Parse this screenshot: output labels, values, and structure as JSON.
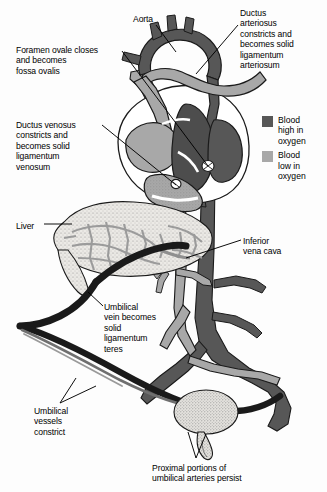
{
  "figure": {
    "background_color": "#fdfdfd",
    "width": 327,
    "height": 492
  },
  "palette": {
    "oxygen_high": "#575757",
    "oxygen_low": "#a8a8a8",
    "constricted_vessel": "#1a1a1a",
    "organ_fill": "#e8e6e2",
    "outline": "#1a1a1a",
    "leader_line": "#000000",
    "text": "#000000"
  },
  "legend": {
    "items": [
      {
        "swatch_color": "#575757",
        "label": "Blood\nhigh in\noxygen",
        "name": "blood-high-oxygen"
      },
      {
        "swatch_color": "#a8a8a8",
        "label": "Blood\nlow in\noxygen",
        "name": "blood-low-oxygen"
      }
    ]
  },
  "labels": [
    {
      "id": "aorta",
      "text": "Aorta",
      "x": 133,
      "y": 14,
      "align": "left"
    },
    {
      "id": "ductus-arteriosus",
      "text": "Ductus\narteriosus\nconstricts and\nbecomes solid\nligamentum\narteriosum",
      "x": 240,
      "y": 8,
      "align": "left"
    },
    {
      "id": "foramen-ovale",
      "text": "Foramen ovale closes\nand becomes\nfossa ovalis",
      "x": 16,
      "y": 45,
      "align": "left"
    },
    {
      "id": "ductus-venosus",
      "text": "Ductus venosus\nconstricts and\nbecomes solid\nligamentum\nvenosum",
      "x": 16,
      "y": 120,
      "align": "left"
    },
    {
      "id": "liver",
      "text": "Liver",
      "x": 16,
      "y": 221,
      "align": "left"
    },
    {
      "id": "inferior-vena-cava",
      "text": "Inferior\nvena cava",
      "x": 243,
      "y": 236,
      "align": "left"
    },
    {
      "id": "umbilical-vein",
      "text": "Umbilical\nvein becomes\nsolid\nligamentum\nteres",
      "x": 104,
      "y": 302,
      "align": "left"
    },
    {
      "id": "umbilical-vessels",
      "text": "Umbilical\nvessels\nconstrict",
      "x": 34,
      "y": 406,
      "align": "left"
    },
    {
      "id": "proximal-umbilical-arteries",
      "text": "Proximal portions of\numbilical arteries persist",
      "x": 152,
      "y": 463,
      "align": "left"
    }
  ],
  "anatomy": {
    "structures": [
      {
        "name": "aortic-arch",
        "oxygenation": "high"
      },
      {
        "name": "brachiocephalic-branches",
        "oxygenation": "high"
      },
      {
        "name": "pulmonary-trunk",
        "oxygenation": "low"
      },
      {
        "name": "ductus-arteriosus-remnant",
        "oxygenation": "low"
      },
      {
        "name": "superior-vena-cava",
        "oxygenation": "low"
      },
      {
        "name": "right-atrium",
        "oxygenation": "low"
      },
      {
        "name": "right-ventricle",
        "oxygenation": "low"
      },
      {
        "name": "left-atrium",
        "oxygenation": "high"
      },
      {
        "name": "left-ventricle",
        "oxygenation": "high"
      },
      {
        "name": "interventricular-septum",
        "oxygenation": "high"
      },
      {
        "name": "foramen-ovale-site",
        "oxygenation": "high"
      },
      {
        "name": "liver",
        "oxygenation": "organ"
      },
      {
        "name": "hepatic-vascular-network",
        "oxygenation": "low"
      },
      {
        "name": "descending-aorta",
        "oxygenation": "high"
      },
      {
        "name": "inferior-vena-cava",
        "oxygenation": "low"
      },
      {
        "name": "common-iliac-arteries",
        "oxygenation": "high"
      },
      {
        "name": "common-iliac-veins",
        "oxygenation": "low"
      },
      {
        "name": "urinary-bladder",
        "oxygenation": "organ"
      },
      {
        "name": "umbilical-vein-constricted",
        "oxygenation": "constricted"
      },
      {
        "name": "umbilical-arteries-constricted",
        "oxygenation": "constricted"
      },
      {
        "name": "ductus-venosus-constricted",
        "oxygenation": "constricted"
      }
    ]
  }
}
